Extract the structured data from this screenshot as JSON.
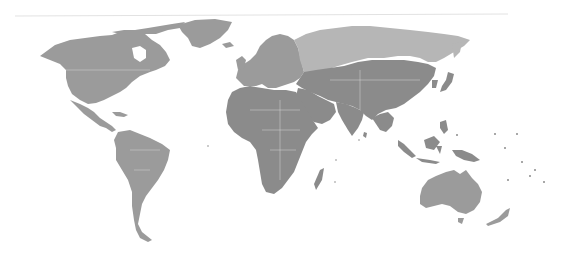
{
  "map": {
    "type": "world-choropleth",
    "projection": "robinson-like",
    "legend": [],
    "colors": {
      "background": "#ffffff",
      "frame_line": "#e2e2e2",
      "border": "#d6d6d6",
      "tier_light": "#b6b6b6",
      "tier_medium": "#9b9b9b",
      "tier_dark": "#8b8b8b"
    },
    "regions": [
      {
        "id": "north-america",
        "tier": "tier_medium"
      },
      {
        "id": "greenland",
        "tier": "tier_medium"
      },
      {
        "id": "central-america-caribbean",
        "tier": "tier_medium"
      },
      {
        "id": "south-america",
        "tier": "tier_medium"
      },
      {
        "id": "europe",
        "tier": "tier_medium"
      },
      {
        "id": "russia",
        "tier": "tier_light"
      },
      {
        "id": "africa",
        "tier": "tier_dark"
      },
      {
        "id": "madagascar",
        "tier": "tier_dark"
      },
      {
        "id": "middle-east",
        "tier": "tier_dark"
      },
      {
        "id": "central-asia",
        "tier": "tier_dark"
      },
      {
        "id": "south-asia",
        "tier": "tier_dark"
      },
      {
        "id": "east-asia",
        "tier": "tier_dark"
      },
      {
        "id": "japan",
        "tier": "tier_dark"
      },
      {
        "id": "southeast-asia",
        "tier": "tier_dark"
      },
      {
        "id": "indonesia",
        "tier": "tier_dark"
      },
      {
        "id": "new-guinea",
        "tier": "tier_dark"
      },
      {
        "id": "australia",
        "tier": "tier_medium"
      },
      {
        "id": "new-zealand",
        "tier": "tier_medium"
      }
    ]
  }
}
